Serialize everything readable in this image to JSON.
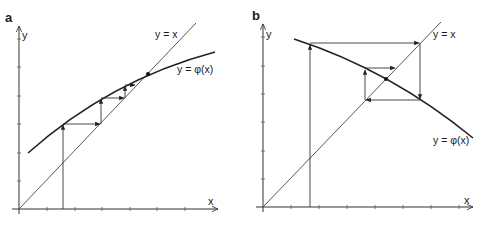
{
  "panels": [
    {
      "id": "a",
      "label": "a",
      "y_axis_label": "y",
      "x_axis_label": "x",
      "identity_label": "y = x",
      "function_label": "y = φ(x)",
      "description": "Monotone convergence (staircase) of fixed-point iteration, 0 < φ'(x) < 1"
    },
    {
      "id": "b",
      "label": "b",
      "y_axis_label": "y",
      "x_axis_label": "x",
      "identity_label": "y = x",
      "function_label": "y = φ(x)",
      "description": "Oscillating convergence (cobweb) of fixed-point iteration, -1 < φ'(x) < 0"
    }
  ],
  "colors": {
    "line": "#333333",
    "background": "#ffffff"
  }
}
